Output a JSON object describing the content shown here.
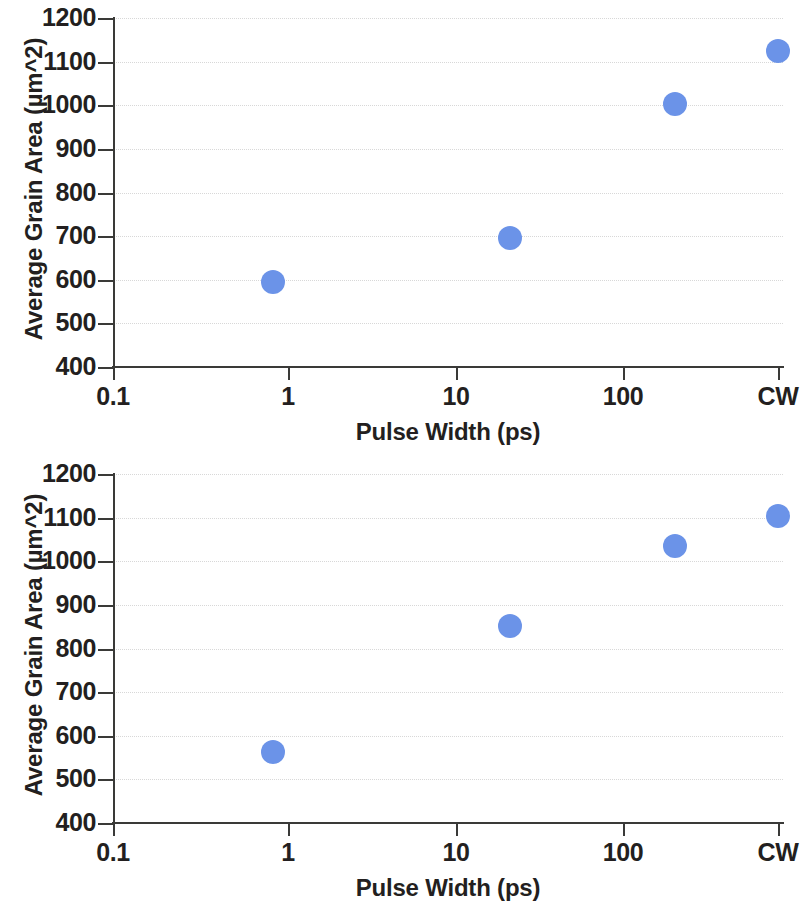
{
  "figure": {
    "marker_color": "#6b93e8",
    "axis_color": "#3a3a38",
    "grid_color": "#d8d8d8"
  },
  "chart_data": [
    {
      "type": "scatter",
      "panel": "top",
      "title": "",
      "xlabel": "Pulse Width (ps)",
      "ylabel": "Average Grain Area (µm^2)",
      "xscale": "log-with-categorical-end",
      "xtick_labels": [
        "0.1",
        "1",
        "10",
        "100",
        "CW"
      ],
      "xtick_values": [
        0.1,
        1,
        10,
        100,
        "CW"
      ],
      "ytick_labels": [
        "400",
        "500",
        "600",
        "700",
        "800",
        "900",
        "1000",
        "1100",
        "1200"
      ],
      "ytick_values": [
        400,
        500,
        600,
        700,
        800,
        900,
        1000,
        1100,
        1200
      ],
      "ylim": [
        400,
        1200
      ],
      "grid": true,
      "legend": "none",
      "points": [
        {
          "x": 0.81,
          "y": 595
        },
        {
          "x": 21,
          "y": 696
        },
        {
          "x": 200,
          "y": 1003
        },
        {
          "x": "CW",
          "y": 1125
        }
      ]
    },
    {
      "type": "scatter",
      "panel": "bottom",
      "title": "",
      "xlabel": "Pulse Width (ps)",
      "ylabel": "Average Grain Area (µm^2)",
      "xscale": "log-with-categorical-end",
      "xtick_labels": [
        "0.1",
        "1",
        "10",
        "100",
        "CW"
      ],
      "xtick_values": [
        0.1,
        1,
        10,
        100,
        "CW"
      ],
      "ytick_labels": [
        "400",
        "500",
        "600",
        "700",
        "800",
        "900",
        "1000",
        "1100",
        "1200"
      ],
      "ytick_values": [
        400,
        500,
        600,
        700,
        800,
        900,
        1000,
        1100,
        1200
      ],
      "ylim": [
        400,
        1200
      ],
      "grid": true,
      "legend": "none",
      "points": [
        {
          "x": 0.81,
          "y": 563
        },
        {
          "x": 21,
          "y": 851
        },
        {
          "x": 200,
          "y": 1035
        },
        {
          "x": "CW",
          "y": 1104
        }
      ]
    }
  ]
}
